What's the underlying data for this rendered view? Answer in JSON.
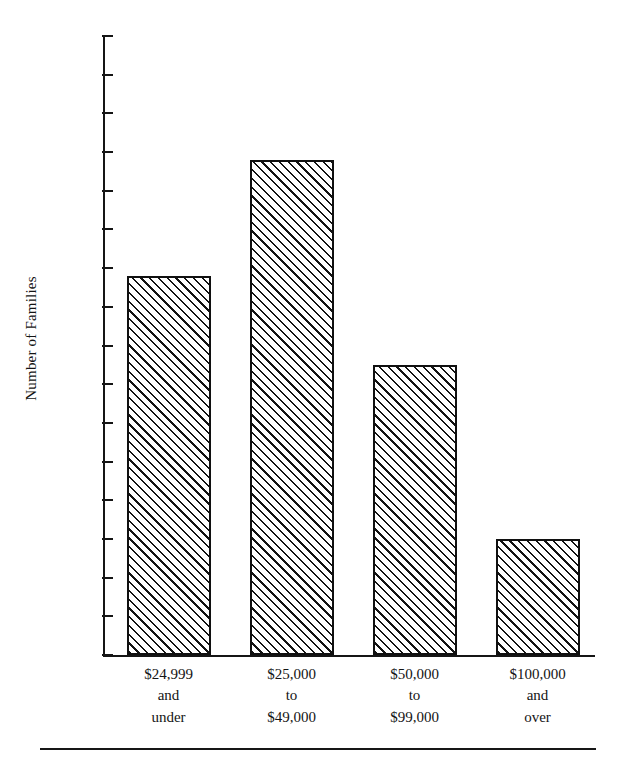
{
  "chart_data": {
    "type": "bar",
    "title": "",
    "subtitle": "",
    "xlabel": "",
    "ylabel": "Number of Families",
    "ylim": [
      0,
      80
    ],
    "ytick_step": 5,
    "yticks": [
      80,
      75,
      70,
      65,
      60,
      55,
      50,
      45,
      40,
      35,
      30,
      25,
      20,
      15,
      10,
      5,
      0
    ],
    "categories": [
      "$24,999 and under",
      "$25,000 to $49,000",
      "$50,000 to $99,000",
      "$100,000 and over"
    ],
    "category_lines": [
      [
        "$24,999",
        "and",
        "under"
      ],
      [
        "$25,000",
        "to",
        "$49,000"
      ],
      [
        "$50,000",
        "to",
        "$99,000"
      ],
      [
        "$100,000",
        "and",
        "over"
      ]
    ],
    "values": [
      49,
      64,
      37.5,
      15
    ],
    "grid": false,
    "legend": null,
    "bar_fill": "diagonal-hatch",
    "bar_edge_color": "#101010",
    "axis_color": "#151515",
    "background": "#ffffff"
  },
  "figure": {
    "y_axis_title": "Number of Families",
    "bottom_rule": true
  }
}
